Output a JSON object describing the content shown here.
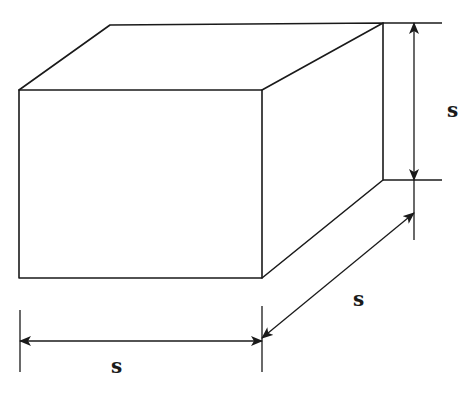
{
  "diagram": {
    "labels": {
      "height": "s",
      "depth": "s",
      "width": "s"
    },
    "colors": {
      "line": "#1a1a1a",
      "background": "#ffffff"
    }
  }
}
